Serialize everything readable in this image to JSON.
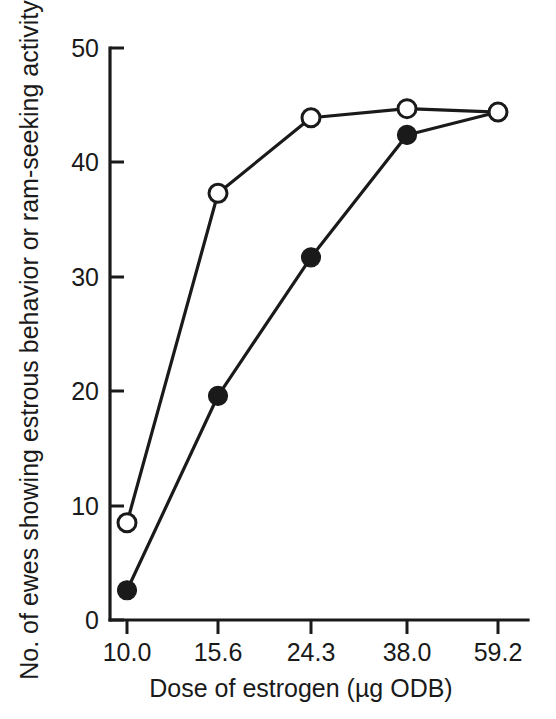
{
  "chart_data": {
    "type": "line",
    "title": "",
    "xlabel": "Dose of estrogen (µg ODB)",
    "ylabel": "No. of ewes showing estrous behavior or ram-seeking activity",
    "categories": [
      "10.0",
      "15.6",
      "24.3",
      "38.0",
      "59.2"
    ],
    "x_tick_labels": [
      "10.0",
      "15.6",
      "24.3",
      "38.0",
      "59.2"
    ],
    "y_tick_labels": [
      "0",
      "10",
      "20",
      "30",
      "40",
      "50"
    ],
    "y_ticks": [
      0,
      10,
      20,
      30,
      40,
      50
    ],
    "ylim": [
      0,
      50
    ],
    "grid": false,
    "legend_position": "none",
    "series": [
      {
        "name": "open-circle-series",
        "marker": "open-circle",
        "color": "#1a1a1a",
        "values": [
          8.5,
          37.3,
          43.9,
          44.7,
          44.4
        ]
      },
      {
        "name": "filled-circle-series",
        "marker": "filled-circle",
        "color": "#1a1a1a",
        "values": [
          2.6,
          19.6,
          31.7,
          42.4,
          44.4
        ]
      }
    ]
  },
  "axes": {
    "y_axis_title": "No. of ewes showing estrous behavior or ram-seeking activity",
    "x_axis_title": "Dose of estrogen (µg ODB)"
  }
}
